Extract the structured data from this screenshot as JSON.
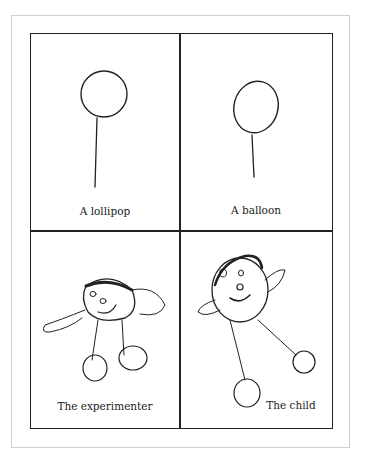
{
  "figure": {
    "panels": [
      {
        "id": "lollipop",
        "caption": "A lollipop"
      },
      {
        "id": "balloon",
        "caption": "A balloon"
      },
      {
        "id": "experimenter",
        "caption": "The experimenter"
      },
      {
        "id": "child",
        "caption": "The child"
      }
    ]
  },
  "colors": {
    "ink": "#222222",
    "frame": "#cfcfcf",
    "background": "#ffffff"
  }
}
